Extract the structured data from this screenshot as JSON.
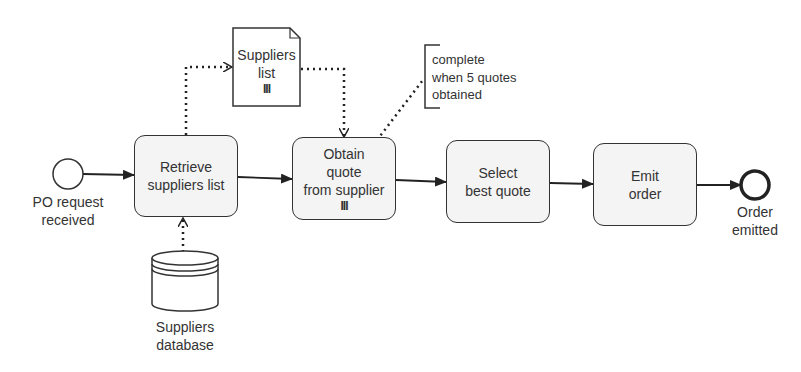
{
  "diagram": {
    "type": "BPMN process",
    "start_event": {
      "label_line1": "PO request",
      "label_line2": "received"
    },
    "tasks": [
      {
        "id": "retrieve",
        "line1": "Retrieve",
        "line2": "suppliers list",
        "line3": "",
        "multi_instance": false
      },
      {
        "id": "obtain",
        "line1": "Obtain",
        "line2": "quote",
        "line3": "from supplier",
        "multi_instance": true,
        "marker": "III"
      },
      {
        "id": "select",
        "line1": "Select",
        "line2": "best quote",
        "line3": "",
        "multi_instance": false
      },
      {
        "id": "emit",
        "line1": "Emit",
        "line2": "order",
        "line3": "",
        "multi_instance": false
      }
    ],
    "end_event": {
      "label_line1": "Order",
      "label_line2": "emitted"
    },
    "data_object": {
      "line1": "Suppliers",
      "line2": "list",
      "marker": "III",
      "icon": "document-icon"
    },
    "data_store": {
      "line1": "Suppliers",
      "line2": "database",
      "icon": "database-icon"
    },
    "annotation": {
      "line1": "complete",
      "line2": "when 5 quotes",
      "line3": "obtained"
    },
    "colors": {
      "stroke": "#333333",
      "task_fill": "#f4f4f4",
      "background": "#ffffff"
    }
  }
}
